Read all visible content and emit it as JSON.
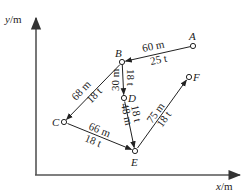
{
  "axes": {
    "y_label_var": "y",
    "y_label_unit": "/m",
    "x_label_var": "x",
    "x_label_unit": "/m"
  },
  "nodes": [
    {
      "id": "A",
      "label": "A",
      "x": 193,
      "y": 46
    },
    {
      "id": "B",
      "label": "B",
      "x": 122,
      "y": 62
    },
    {
      "id": "C",
      "label": "C",
      "x": 64,
      "y": 122
    },
    {
      "id": "D",
      "label": "D",
      "x": 124,
      "y": 98
    },
    {
      "id": "E",
      "label": "E",
      "x": 135,
      "y": 151
    },
    {
      "id": "F",
      "label": "F",
      "x": 189,
      "y": 77
    }
  ],
  "edges": [
    {
      "from": "A",
      "to": "B",
      "distance": "60 m",
      "load": "25 t"
    },
    {
      "from": "B",
      "to": "C",
      "distance": "68 m",
      "load": "18 t"
    },
    {
      "from": "B",
      "to": "D",
      "distance": "30 m",
      "load": "18 t"
    },
    {
      "from": "C",
      "to": "E",
      "distance": "66 m",
      "load": "18 t"
    },
    {
      "from": "D",
      "to": "E",
      "distance": "48 m",
      "load": "18 t"
    },
    {
      "from": "E",
      "to": "F",
      "distance": "75 m",
      "load": "18 t"
    }
  ]
}
